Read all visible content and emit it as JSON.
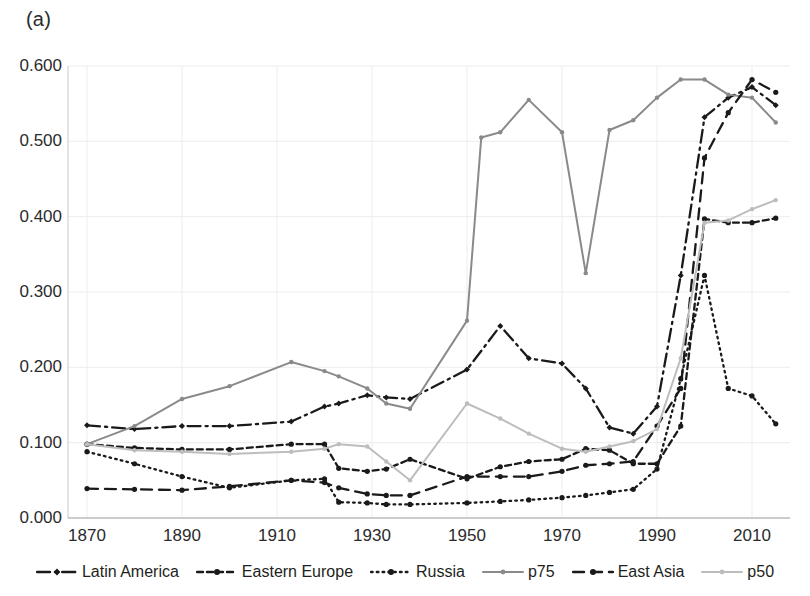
{
  "figure": {
    "panel_label": "(a)"
  },
  "chart_data": {
    "type": "line",
    "title": "",
    "xlabel": "",
    "ylabel": "",
    "xlim": [
      1866,
      2018
    ],
    "ylim": [
      0.0,
      0.6
    ],
    "grid": true,
    "legend_position": "bottom",
    "xticks": [
      "1870",
      "1890",
      "1910",
      "1930",
      "1950",
      "1970",
      "1990",
      "2010"
    ],
    "xtick_values": [
      1870,
      1890,
      1910,
      1930,
      1950,
      1970,
      1990,
      2010
    ],
    "yticks": [
      "0.000",
      "0.100",
      "0.200",
      "0.300",
      "0.400",
      "0.500",
      "0.600"
    ],
    "ytick_values": [
      0.0,
      0.1,
      0.2,
      0.3,
      0.4,
      0.5,
      0.6
    ],
    "series": [
      {
        "name": "Latin America",
        "color": "#1a1a1a",
        "dash": "dashdot",
        "marker": "diamond",
        "x": [
          1870,
          1880,
          1890,
          1900,
          1913,
          1920,
          1923,
          1929,
          1933,
          1938,
          1950,
          1957,
          1963,
          1970,
          1975,
          1980,
          1985,
          1990,
          1995,
          2000,
          2005,
          2010,
          2015
        ],
        "y": [
          0.123,
          0.118,
          0.122,
          0.122,
          0.128,
          0.148,
          0.152,
          0.163,
          0.16,
          0.158,
          0.197,
          0.255,
          0.212,
          0.205,
          0.172,
          0.12,
          0.112,
          0.148,
          0.322,
          0.532,
          0.558,
          0.572,
          0.548
        ]
      },
      {
        "name": "Eastern Europe",
        "color": "#1a1a1a",
        "dash": "dashed",
        "marker": "circle",
        "x": [
          1870,
          1880,
          1890,
          1900,
          1913,
          1920,
          1923,
          1929,
          1933,
          1938,
          1950,
          1957,
          1963,
          1970,
          1975,
          1980,
          1985,
          1990,
          1995,
          2000,
          2005,
          2010,
          2015
        ],
        "y": [
          0.098,
          0.093,
          0.091,
          0.091,
          0.098,
          0.098,
          0.066,
          0.062,
          0.065,
          0.078,
          0.052,
          0.068,
          0.075,
          0.078,
          0.092,
          0.09,
          0.072,
          0.072,
          0.122,
          0.397,
          0.392,
          0.392,
          0.398
        ]
      },
      {
        "name": "Russia",
        "color": "#1a1a1a",
        "dash": "dotted",
        "marker": "circle",
        "x": [
          1870,
          1880,
          1890,
          1900,
          1913,
          1920,
          1923,
          1929,
          1933,
          1938,
          1950,
          1957,
          1963,
          1970,
          1975,
          1980,
          1985,
          1990,
          1995,
          2000,
          2005,
          2010,
          2015
        ],
        "y": [
          0.088,
          0.072,
          0.055,
          0.04,
          0.05,
          0.052,
          0.021,
          0.02,
          0.018,
          0.018,
          0.02,
          0.022,
          0.024,
          0.027,
          0.03,
          0.034,
          0.038,
          0.065,
          0.185,
          0.322,
          0.172,
          0.162,
          0.125
        ]
      },
      {
        "name": "p75",
        "color": "#8a8a8a",
        "dash": "solid",
        "marker": "circle",
        "x": [
          1870,
          1880,
          1890,
          1900,
          1913,
          1920,
          1923,
          1929,
          1933,
          1938,
          1950,
          1953,
          1957,
          1963,
          1970,
          1975,
          1980,
          1985,
          1990,
          1995,
          2000,
          2005,
          2010,
          2015
        ],
        "y": [
          0.098,
          0.122,
          0.158,
          0.175,
          0.207,
          0.195,
          0.188,
          0.172,
          0.152,
          0.145,
          0.262,
          0.505,
          0.512,
          0.555,
          0.512,
          0.325,
          0.515,
          0.528,
          0.558,
          0.582,
          0.582,
          0.562,
          0.558,
          0.525
        ]
      },
      {
        "name": "East Asia",
        "color": "#1a1a1a",
        "dash": "longdash",
        "marker": "circle",
        "x": [
          1870,
          1880,
          1890,
          1900,
          1913,
          1920,
          1923,
          1929,
          1933,
          1938,
          1950,
          1957,
          1963,
          1970,
          1975,
          1980,
          1985,
          1990,
          1995,
          2000,
          2005,
          2010,
          2015
        ],
        "y": [
          0.039,
          0.038,
          0.037,
          0.042,
          0.05,
          0.047,
          0.04,
          0.032,
          0.03,
          0.03,
          0.055,
          0.055,
          0.055,
          0.062,
          0.07,
          0.072,
          0.075,
          0.122,
          0.172,
          0.478,
          0.538,
          0.582,
          0.565
        ]
      },
      {
        "name": "p50",
        "color": "#bdbdbd",
        "dash": "solid",
        "marker": "circle",
        "x": [
          1870,
          1880,
          1890,
          1900,
          1913,
          1920,
          1923,
          1929,
          1933,
          1938,
          1950,
          1957,
          1963,
          1970,
          1975,
          1980,
          1985,
          1990,
          1995,
          2000,
          2005,
          2010,
          2015
        ],
        "y": [
          0.098,
          0.09,
          0.088,
          0.085,
          0.088,
          0.092,
          0.098,
          0.095,
          0.075,
          0.05,
          0.152,
          0.132,
          0.112,
          0.092,
          0.088,
          0.095,
          0.102,
          0.118,
          0.212,
          0.392,
          0.395,
          0.41,
          0.422
        ]
      }
    ]
  },
  "legend": {
    "items": [
      {
        "label": "Latin America"
      },
      {
        "label": "Eastern Europe"
      },
      {
        "label": "Russia"
      },
      {
        "label": "p75"
      },
      {
        "label": "East Asia"
      },
      {
        "label": "p50"
      }
    ]
  }
}
